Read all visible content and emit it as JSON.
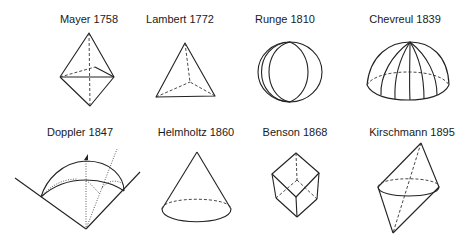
{
  "figures": [
    {
      "id": "mayer",
      "label": "Mayer 1758",
      "shape": "double tetrahedron (bipyramid)"
    },
    {
      "id": "lambert",
      "label": "Lambert 1772",
      "shape": "tetrahedron"
    },
    {
      "id": "runge",
      "label": "Runge 1810",
      "shape": "sphere"
    },
    {
      "id": "chevreul",
      "label": "Chevreul 1839",
      "shape": "hemisphere"
    },
    {
      "id": "doppler",
      "label": "Doppler 1847",
      "shape": "dome in cone"
    },
    {
      "id": "helmholtz",
      "label": "Helmholtz 1860",
      "shape": "cone"
    },
    {
      "id": "benson",
      "label": "Benson 1868",
      "shape": "cube"
    },
    {
      "id": "kirschmann",
      "label": "Kirschmann 1895",
      "shape": "double cone"
    }
  ]
}
